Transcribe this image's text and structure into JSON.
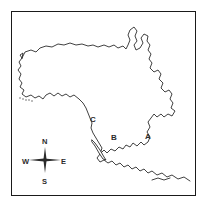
{
  "figure": {
    "type": "outline-map",
    "frame": {
      "visible": true,
      "color": "#1a1a1a"
    },
    "background_color": "#ffffff",
    "line_color": "#2b2b2b"
  },
  "region_labels": [
    {
      "id": "A",
      "text": "A",
      "x": 148,
      "y": 137
    },
    {
      "id": "B",
      "text": "B",
      "x": 114,
      "y": 138
    },
    {
      "id": "C",
      "text": "C",
      "x": 93,
      "y": 120
    }
  ],
  "compass": {
    "name": "compass-rose",
    "north": "N",
    "south": "S",
    "east": "E",
    "west": "W"
  }
}
